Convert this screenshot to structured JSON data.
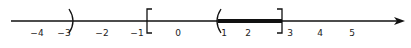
{
  "diagram": {
    "type": "number-line",
    "axis": {
      "x_start": 11,
      "x_end": 405,
      "y": 21,
      "color": "#111111"
    },
    "tick_labels": [
      {
        "text": "-4",
        "x": 37
      },
      {
        "text": "-3",
        "x": 64
      },
      {
        "text": "-2",
        "x": 102
      },
      {
        "text": "-1",
        "x": 137
      },
      {
        "text": "0",
        "x": 178
      },
      {
        "text": "1",
        "x": 224
      },
      {
        "text": "2",
        "x": 248
      },
      {
        "text": "3",
        "x": 290
      },
      {
        "text": "4",
        "x": 320
      },
      {
        "text": "5",
        "x": 352
      }
    ],
    "brackets": [
      {
        "symbol": ")",
        "value": -3,
        "type": "open-right",
        "x": 73
      },
      {
        "symbol": "[",
        "value": -1,
        "type": "closed-left",
        "x": 147
      },
      {
        "symbol": "(",
        "value": 1,
        "type": "open-left",
        "x": 217
      },
      {
        "symbol": "]",
        "value": 3,
        "type": "closed-right",
        "x": 282
      }
    ],
    "highlighted_interval": {
      "label": "(1, 3]",
      "x_start": 218,
      "x_end": 282,
      "thickness": 4
    }
  }
}
